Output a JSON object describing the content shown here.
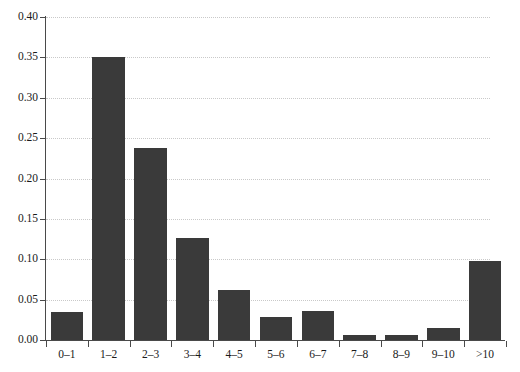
{
  "chart_data": {
    "type": "bar",
    "title": "",
    "subtitle": "",
    "xlabel": "",
    "ylabel": "",
    "categories": [
      "0–1",
      "1–2",
      "2–3",
      "3–4",
      "4–5",
      "5–6",
      "6–7",
      "7–8",
      "8–9",
      "9–10",
      ">10"
    ],
    "values": [
      0.035,
      0.35,
      0.238,
      0.126,
      0.062,
      0.028,
      0.036,
      0.006,
      0.006,
      0.015,
      0.098
    ],
    "ylim": [
      0.0,
      0.4
    ],
    "xlim_categories": 11,
    "ytick_labels": [
      "0.00",
      "0.05",
      "0.10",
      "0.15",
      "0.20",
      "0.25",
      "0.30",
      "0.35",
      "0.40"
    ],
    "ytick_values": [
      0.0,
      0.05,
      0.1,
      0.15,
      0.2,
      0.25,
      0.3,
      0.35,
      0.4
    ],
    "grid": "horizontal-dotted",
    "legend": "none",
    "bar_color": "#3a3a3a",
    "grid_color": "#c9c9c9",
    "axis_color": "#4a4a4a",
    "text_color": "#1a1a1a",
    "annotations": []
  }
}
